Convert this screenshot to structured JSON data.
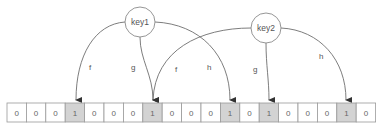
{
  "diagram": {
    "keys": [
      {
        "id": "key1",
        "label": "key1",
        "cx": 140,
        "cy": 22
      },
      {
        "id": "key2",
        "label": "key2",
        "cx": 266,
        "cy": 28
      }
    ],
    "edges": [
      {
        "from": "key1",
        "label": "f",
        "target_index": 3
      },
      {
        "from": "key1",
        "label": "g",
        "target_index": 7
      },
      {
        "from": "key1",
        "label": "h",
        "target_index": 11
      },
      {
        "from": "key2",
        "label": "f",
        "target_index": 7
      },
      {
        "from": "key2",
        "label": "g",
        "target_index": 13
      },
      {
        "from": "key2",
        "label": "h",
        "target_index": 17
      }
    ],
    "bit_array": [
      "0",
      "0",
      "0",
      "1",
      "0",
      "0",
      "0",
      "1",
      "0",
      "0",
      "0",
      "1",
      "0",
      "1",
      "0",
      "0",
      "0",
      "1",
      "0"
    ],
    "colors": {
      "set_bit": "#d3d3d3",
      "unset_bit": "#ffffff",
      "line": "#6e6e6e"
    }
  }
}
